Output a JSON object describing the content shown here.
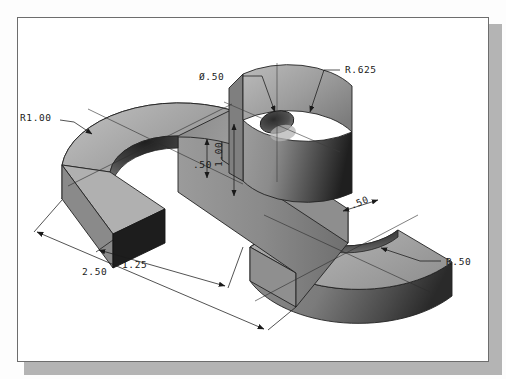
{
  "drawing": {
    "title": "Isometric pictorial of S-shaped bracket with central boss",
    "sheet": {
      "border_color": "#6d6d6d",
      "paper_color": "#ffffff",
      "shadow_color": "#b4b4b4"
    },
    "shading": {
      "top_face": "#a9a9a9",
      "top_face_light": "#b9b9b9",
      "front_face": "#8c8c8c",
      "side_face": "#6e6e6e",
      "end_face_dark": "#1d1d1d",
      "inner_bore_dark": "#3a3a3a",
      "outline": "#232323"
    },
    "annotations": [
      {
        "id": "r1-00",
        "label": "R1.00",
        "x": 20,
        "y": 118,
        "leader_to_x": 82,
        "leader_to_y": 132
      },
      {
        "id": "dia-50",
        "label": "Ø.50",
        "x": 200,
        "y": 79,
        "leader_to_x": 272,
        "leader_to_y": 120
      },
      {
        "id": "r-625",
        "label": "R.625",
        "x": 345,
        "y": 72,
        "leader_to_x": 309,
        "leader_to_y": 113
      },
      {
        "id": "r-50",
        "label": "R.50",
        "x": 446,
        "y": 263,
        "leader_to_x": 381,
        "leader_to_y": 248
      },
      {
        "id": "dim-1-00",
        "label": "1.00",
        "x": 222,
        "y": 150
      },
      {
        "id": "dim-50-v",
        "label": ".50",
        "x": 197,
        "y": 159
      },
      {
        "id": "dim-50-w",
        "label": ".50",
        "x": 351,
        "y": 206
      },
      {
        "id": "dim-2-50",
        "label": "2.50",
        "x": 85,
        "y": 271
      },
      {
        "id": "dim-1-25",
        "label": "1.25",
        "x": 124,
        "y": 265
      }
    ],
    "dimension_values": {
      "outer_arc_radius": "R1.00",
      "hole_diameter": "Ø.50",
      "boss_radius": "R.625",
      "inner_arc_radius": "R.50",
      "boss_height": "1.00",
      "plate_thickness": "1.00",
      "step_height": ".50",
      "arm_width": ".50",
      "overall_length": "2.50",
      "arm_offset": "1.25"
    }
  }
}
